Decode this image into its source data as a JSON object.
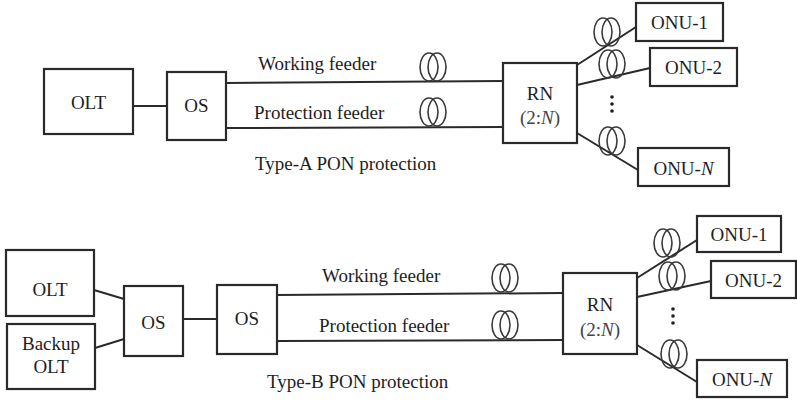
{
  "figure": {
    "type_a": {
      "caption": "Type-A PON protection",
      "olt": "OLT",
      "os": "OS",
      "working_feeder": "Working feeder",
      "protection_feeder": "Protection feeder",
      "rn": {
        "line1": "RN",
        "ratio_prefix": "(2:",
        "ratio_n": "N",
        "ratio_suffix": ")"
      },
      "onus": [
        {
          "prefix": "ONU-",
          "index": "1"
        },
        {
          "prefix": "ONU-",
          "index": "2"
        },
        {
          "prefix": "ONU-",
          "index": "N"
        }
      ],
      "ellipsis": "⋮"
    },
    "type_b": {
      "caption": "Type-B PON protection",
      "olt": "OLT",
      "backup_olt": {
        "line1": "Backup",
        "line2": "OLT"
      },
      "os1": "OS",
      "os2": "OS",
      "working_feeder": "Working feeder",
      "protection_feeder": "Protection feeder",
      "rn": {
        "line1": "RN",
        "ratio_prefix": "(2:",
        "ratio_n": "N",
        "ratio_suffix": ")"
      },
      "onus": [
        {
          "prefix": "ONU-",
          "index": "1"
        },
        {
          "prefix": "ONU-",
          "index": "2"
        },
        {
          "prefix": "ONU-",
          "index": "N"
        }
      ],
      "ellipsis": "⋮"
    },
    "colors": {
      "stroke": "#2a2a2a",
      "text": "#1e1e1e",
      "background": "#ffffff"
    }
  }
}
